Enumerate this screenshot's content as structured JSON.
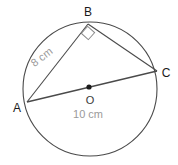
{
  "diagram": {
    "shape_type": "circle-with-inscribed-triangle",
    "stroke_color": "#4a4a4a",
    "measure_text_color": "#9a9a9a",
    "label_text_color": "#1a1a1a",
    "background_color": "#ffffff",
    "circle": {
      "center_label": "O",
      "center_x": 90,
      "center_y": 89,
      "radius": 67
    },
    "points": [
      {
        "label": "A",
        "x": 27,
        "y": 102,
        "label_x": 17,
        "label_y": 112
      },
      {
        "label": "B",
        "x": 88,
        "y": 24,
        "label_x": 88,
        "label_y": 16
      },
      {
        "label": "C",
        "x": 157,
        "y": 71,
        "label_x": 166,
        "label_y": 77
      },
      {
        "label": "O",
        "x": 89,
        "y": 87,
        "label_x": 90,
        "label_y": 104
      }
    ],
    "segments": [
      {
        "name": "AB",
        "from": "A",
        "to": "B",
        "measure": "8 cm"
      },
      {
        "name": "BC",
        "from": "B",
        "to": "C",
        "measure": ""
      },
      {
        "name": "AC",
        "from": "A",
        "to": "C",
        "measure": "10 cm"
      }
    ],
    "measures": {
      "side_ab": "8 cm",
      "side_ab_x": 44,
      "side_ab_y": 60,
      "side_ab_rotation": -38,
      "diameter_ac": "10 cm",
      "diameter_ac_x": 88,
      "diameter_ac_y": 118
    },
    "right_angle": {
      "at_vertex": "B",
      "marker": "square",
      "marker_x": 88,
      "marker_y": 33,
      "marker_size": 9
    }
  }
}
